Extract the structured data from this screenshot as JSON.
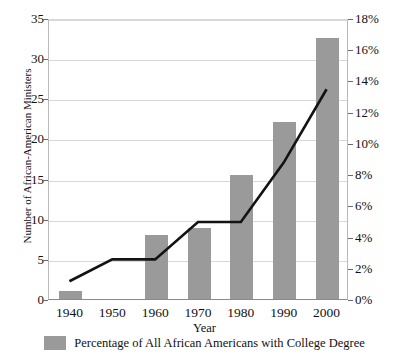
{
  "chart_data": {
    "type": "bar",
    "title": "",
    "categories": [
      "1940",
      "1950",
      "1960",
      "1970",
      "1980",
      "1990",
      "2000"
    ],
    "xlabel": "Year",
    "ylabel": "Number of African-American Ministers",
    "ylabel_right": "",
    "ylim": [
      0,
      35
    ],
    "ylim_right": [
      0,
      18
    ],
    "grid": true,
    "legend_position": "bottom",
    "series": [
      {
        "name": "Number of African-American Ministers",
        "type": "bar",
        "axis": "left",
        "color": "#9a9a9a",
        "values": [
          1,
          null,
          8,
          8.8,
          15.5,
          22,
          32.5
        ]
      },
      {
        "name": "Percentage of All African Americans  with College Degree",
        "type": "line",
        "axis": "right",
        "color": "#131313",
        "unit": "%",
        "values": [
          1.2,
          2.6,
          2.6,
          5.0,
          5.0,
          8.8,
          13.5
        ]
      }
    ],
    "yticks_left": [
      "0",
      "5",
      "10",
      "15",
      "20",
      "25",
      "30",
      "35"
    ],
    "yticks_right": [
      "0%",
      "2%",
      "4%",
      "6%",
      "8%",
      "10%",
      "12%",
      "14%",
      "16%",
      "18%"
    ],
    "legend": [
      {
        "label": "Percentage of All African Americans  with College Degree",
        "swatch_color": "#9a9a9a"
      }
    ]
  }
}
